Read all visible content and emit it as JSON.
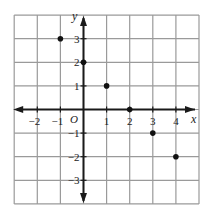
{
  "chart_data": {
    "type": "scatter",
    "title": "",
    "xlabel": "x",
    "ylabel": "y",
    "origin_label": "O",
    "xlim": [
      -3,
      5
    ],
    "ylim": [
      -4,
      4
    ],
    "grid": true,
    "x_ticks": [
      -2,
      -1,
      1,
      2,
      3,
      4
    ],
    "x_tick_labels": [
      "−2",
      "−1",
      "1",
      "2",
      "3",
      "4"
    ],
    "y_ticks": [
      3,
      2,
      1,
      -1,
      -2,
      -3
    ],
    "y_tick_labels": [
      "3",
      "2",
      "1",
      "−1",
      "−2",
      "−3"
    ],
    "points": [
      {
        "x": -1,
        "y": 3
      },
      {
        "x": 0,
        "y": 2
      },
      {
        "x": 1,
        "y": 1
      },
      {
        "x": 2,
        "y": 0
      },
      {
        "x": 3,
        "y": -1
      },
      {
        "x": 4,
        "y": -2
      }
    ],
    "colors": {
      "grid": "#9a9a9a",
      "axis": "#1a1a1a",
      "point": "#111111"
    }
  }
}
